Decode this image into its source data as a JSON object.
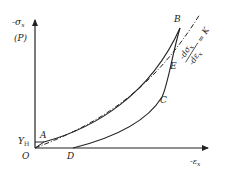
{
  "diagram": {
    "y_axis": {
      "label": "-σ",
      "label_sub": "x",
      "label2": "(P)"
    },
    "x_axis": {
      "label": "-ε",
      "label_sub": "x"
    },
    "points": {
      "O": "O",
      "A": "A",
      "B": "B",
      "C": "C",
      "D": "D",
      "E": "E"
    },
    "yield_label": "Y",
    "yield_sub": "H",
    "tangent_label": {
      "numerator": "-dσ",
      "numerator_sub": "x",
      "denominator": "-dε",
      "denominator_sub": "x",
      "equals": "= K"
    },
    "colors": {
      "line": "#222222",
      "background": "#ffffff"
    }
  }
}
